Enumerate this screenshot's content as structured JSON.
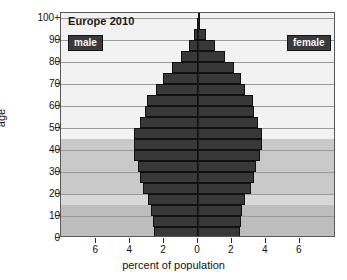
{
  "chart_data": {
    "type": "bar",
    "subtype": "population-pyramid",
    "title": "Europe 2010",
    "xlabel": "percent of population",
    "ylabel": "age",
    "xlim": [
      -7.8,
      7.8
    ],
    "xticks": [
      6,
      4,
      2,
      0,
      2,
      4,
      6
    ],
    "xtick_values": [
      -6,
      -4,
      -2,
      0,
      2,
      4,
      6
    ],
    "ylim": [
      0,
      102.5
    ],
    "yticks": [
      "0",
      "10",
      "20",
      "30",
      "40",
      "50",
      "60",
      "70",
      "80",
      "90",
      "100+"
    ],
    "ytick_values": [
      0,
      10,
      20,
      30,
      40,
      50,
      60,
      70,
      80,
      90,
      100
    ],
    "grid": true,
    "legend_position": "inside-top",
    "age_groups": [
      "0-4",
      "5-9",
      "10-14",
      "15-19",
      "20-24",
      "25-29",
      "30-34",
      "35-39",
      "40-44",
      "45-49",
      "50-54",
      "55-59",
      "60-64",
      "65-69",
      "70-74",
      "75-79",
      "80-84",
      "85-89",
      "90-94",
      "95-99",
      "100+"
    ],
    "series": [
      {
        "name": "male",
        "side": "left",
        "color": "#383838",
        "values": [
          2.6,
          2.65,
          2.75,
          2.95,
          3.25,
          3.4,
          3.55,
          3.75,
          3.8,
          3.75,
          3.45,
          3.15,
          3.0,
          2.45,
          2.05,
          1.55,
          1.0,
          0.55,
          0.22,
          0.06,
          0.02
        ]
      },
      {
        "name": "female",
        "side": "right",
        "color": "#383838",
        "values": [
          2.48,
          2.52,
          2.62,
          2.8,
          3.1,
          3.28,
          3.45,
          3.65,
          3.78,
          3.78,
          3.55,
          3.3,
          3.25,
          2.78,
          2.55,
          2.15,
          1.6,
          1.0,
          0.48,
          0.14,
          0.04
        ]
      }
    ],
    "background_bands": [
      {
        "from_age": 20,
        "to_age": 45,
        "color": "#c9c9c9",
        "name": "mid-band"
      },
      {
        "from_age": 0,
        "to_age": 15,
        "color": "#bdbdbd",
        "name": "low-band"
      },
      {
        "from_age": 15,
        "to_age": 20,
        "color": "#d8d8d8",
        "name": "low-mid-band"
      },
      {
        "from_age": 45,
        "to_age": 102.5,
        "color": "#f2f2f2",
        "name": "high-band"
      }
    ]
  },
  "legend": {
    "male_label": "male",
    "female_label": "female"
  },
  "colors": {
    "bar": "#383838",
    "bar_edge": "#101010",
    "frame": "#58585a",
    "gridline": "#9a9a9a",
    "zero_axis": "#1a1a1a",
    "tag_bg": "#3a3a3a",
    "tag_fg": "#f4f4f4",
    "plot_bg": "#f2f2f2"
  }
}
